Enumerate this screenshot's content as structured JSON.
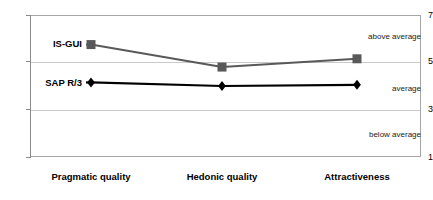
{
  "chart_data": {
    "type": "line",
    "title": "",
    "xlabel": "",
    "ylabel": "",
    "categories": [
      "Pragmatic quality",
      "Hedonic quality",
      "Attractiveness"
    ],
    "series": [
      {
        "name": "IS-GUI",
        "values": [
          5.75,
          4.8,
          5.15
        ],
        "color": "#595959",
        "marker": "square"
      },
      {
        "name": "SAP R/3",
        "values": [
          4.15,
          4.0,
          4.05
        ],
        "color": "#000000",
        "marker": "diamond"
      }
    ],
    "ylim": [
      1,
      7
    ],
    "yticks": [
      1,
      3,
      5,
      7
    ],
    "ytick_labels": [
      "1",
      "3",
      "5",
      "7"
    ],
    "grid": true,
    "gridlines_at": [
      3,
      5
    ],
    "legend": "inline-series-labels",
    "annotations": [
      {
        "text": "above average",
        "value_band": [
          5,
          7
        ]
      },
      {
        "text": "average",
        "value_band": [
          3,
          5
        ]
      },
      {
        "text": "below average",
        "value_band": [
          1,
          3
        ]
      }
    ]
  },
  "axis": {
    "tick_1": "1",
    "tick_3": "3",
    "tick_5": "5",
    "tick_7": "7"
  },
  "categories": {
    "c0": "Pragmatic quality",
    "c1": "Hedonic quality",
    "c2": "Attractiveness"
  },
  "series_labels": {
    "s0": "IS-GUI",
    "s1": "SAP R/3"
  },
  "bands": {
    "above": "above average",
    "mid": "average",
    "below": "below average"
  },
  "colors": {
    "is_gui": "#595959",
    "sap_r3": "#000000",
    "grid": "#c9c9c9",
    "frame": "#a6a6a6"
  }
}
